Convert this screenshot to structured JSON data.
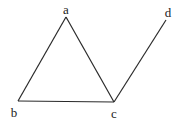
{
  "diagram": {
    "type": "graph",
    "nodes": [
      {
        "id": "a",
        "label": "a",
        "x": 66,
        "y": 17,
        "lx": 66,
        "ly": 14
      },
      {
        "id": "b",
        "label": "b",
        "x": 18,
        "y": 101,
        "lx": 14,
        "ly": 117
      },
      {
        "id": "c",
        "label": "c",
        "x": 114,
        "y": 102,
        "lx": 114,
        "ly": 118
      },
      {
        "id": "d",
        "label": "d",
        "x": 166,
        "y": 20,
        "lx": 168,
        "ly": 17
      }
    ],
    "edges": [
      {
        "from": "a",
        "to": "b"
      },
      {
        "from": "a",
        "to": "c"
      },
      {
        "from": "b",
        "to": "c"
      },
      {
        "from": "c",
        "to": "d"
      }
    ],
    "colors": {
      "line": "#2a2a2a",
      "text": "#222222",
      "background": "#ffffff"
    }
  }
}
